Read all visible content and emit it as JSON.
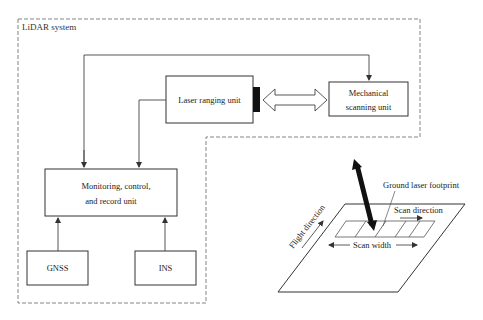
{
  "system_label": "LiDAR system",
  "blocks": {
    "laser_ranging": "Laser ranging unit",
    "mechanical_scanning": [
      "Mechanical",
      "scanning unit"
    ],
    "monitoring": [
      "Monitoring, control,",
      "and record unit"
    ],
    "gnss": "GNSS",
    "ins": "INS"
  },
  "ground_panel": {
    "footprint_label": "Ground laser footprint",
    "scan_direction_label": "Scan direction",
    "scan_width_label": "Scan width",
    "flight_direction_label": "Flight direction"
  }
}
